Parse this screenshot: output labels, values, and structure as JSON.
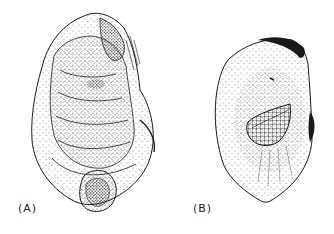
{
  "figure": {
    "panels": [
      {
        "id": "A",
        "label": "(A)",
        "view": "exterior of valve"
      },
      {
        "id": "B",
        "label": "(B)",
        "view": "interior of valve with muscle scar"
      }
    ],
    "colors": {
      "ink": "#1a1a1a",
      "background": "#ffffff"
    }
  }
}
